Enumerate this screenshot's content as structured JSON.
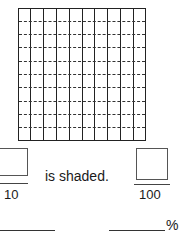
{
  "grid": {
    "columns": 10,
    "rows": 10,
    "shaded_cells": 0
  },
  "fraction_tenths": {
    "denominator": "10"
  },
  "sentence": {
    "text": "is shaded."
  },
  "fraction_hundredths": {
    "denominator": "100"
  },
  "answers": {
    "decimal_blank": "",
    "percent_blank": "",
    "percent_sign": "%"
  }
}
